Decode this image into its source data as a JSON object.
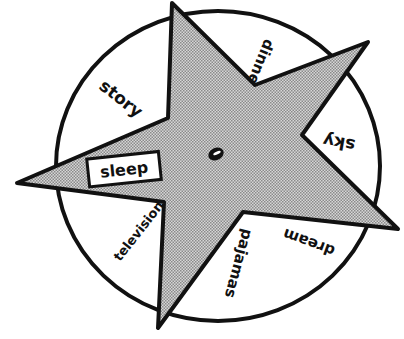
{
  "illustration": {
    "title": "Bedtime routine spinner wheel",
    "wheel_labels": [
      {
        "id": "story",
        "text": "story"
      },
      {
        "id": "dinner",
        "text": "dinner"
      },
      {
        "id": "sky",
        "text": "sky"
      },
      {
        "id": "dream",
        "text": "dream"
      },
      {
        "id": "pajamas",
        "text": "pajamas"
      },
      {
        "id": "television",
        "text": "television"
      }
    ],
    "center_label": "sleep",
    "colors": {
      "outline": "#111111",
      "star_fill": "#bdbdbd",
      "background": "#ffffff"
    }
  }
}
